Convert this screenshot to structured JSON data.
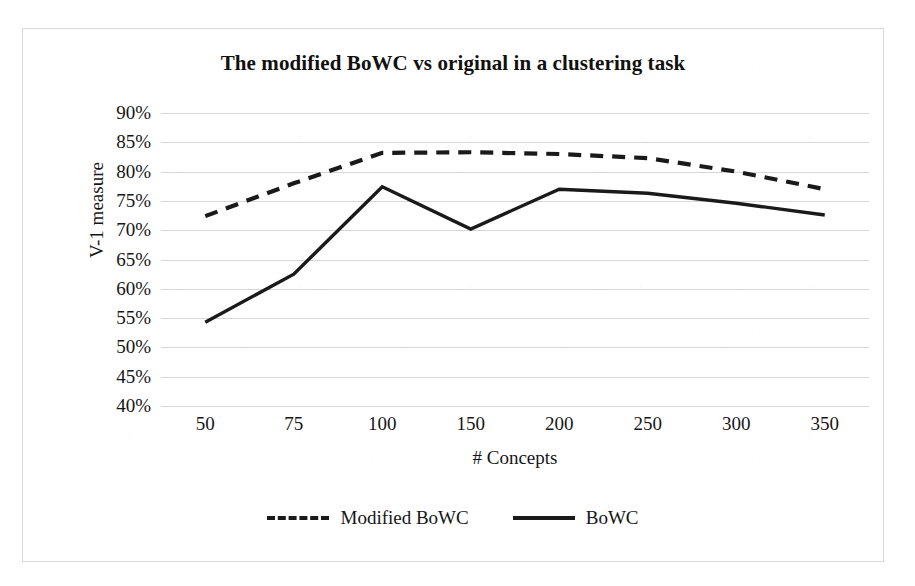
{
  "chart_data": {
    "type": "line",
    "title": "The modified BoWC vs original in a clustering task",
    "xlabel": "# Concepts",
    "ylabel": "V-1 measure",
    "categories": [
      "50",
      "75",
      "100",
      "150",
      "200",
      "250",
      "300",
      "350"
    ],
    "ylim": [
      40,
      90
    ],
    "ytick_step": 5,
    "ytick_labels": [
      "90%",
      "85%",
      "80%",
      "75%",
      "70%",
      "65%",
      "60%",
      "55%",
      "50%",
      "45%",
      "40%"
    ],
    "ytick_values": [
      90,
      85,
      80,
      75,
      70,
      65,
      60,
      55,
      50,
      45,
      40
    ],
    "grid": true,
    "legend_position": "bottom",
    "series": [
      {
        "name": "Modified BoWC",
        "style": "dashed",
        "color": "#1a1a1a",
        "values": [
          72.4,
          78.0,
          83.2,
          83.3,
          83.0,
          82.3,
          80.0,
          77.0
        ]
      },
      {
        "name": "BoWC",
        "style": "solid",
        "color": "#1a1a1a",
        "values": [
          54.3,
          62.5,
          77.4,
          70.2,
          77.0,
          76.3,
          74.6,
          72.6
        ]
      }
    ]
  },
  "legend": {
    "entries": [
      {
        "label": "Modified BoWC",
        "style": "dashed"
      },
      {
        "label": "BoWC",
        "style": "solid"
      }
    ]
  }
}
